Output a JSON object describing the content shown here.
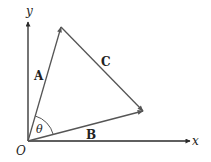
{
  "diagram": {
    "type": "vector-triangle",
    "colors": {
      "axis": "#2a2a2a",
      "vector": "#555555",
      "text": "#222222",
      "background": "#ffffff"
    },
    "axes": {
      "x_label": "x",
      "y_label": "y",
      "origin_label": "O"
    },
    "vectors": [
      {
        "name": "A",
        "label": "A",
        "from": "O",
        "to": "tip-A"
      },
      {
        "name": "B",
        "label": "B",
        "from": "O",
        "to": "tip-B"
      },
      {
        "name": "C",
        "label": "C",
        "from": "tip-A",
        "to": "tip-B"
      }
    ],
    "angle": {
      "label": "θ",
      "between": [
        "A",
        "B"
      ]
    }
  }
}
